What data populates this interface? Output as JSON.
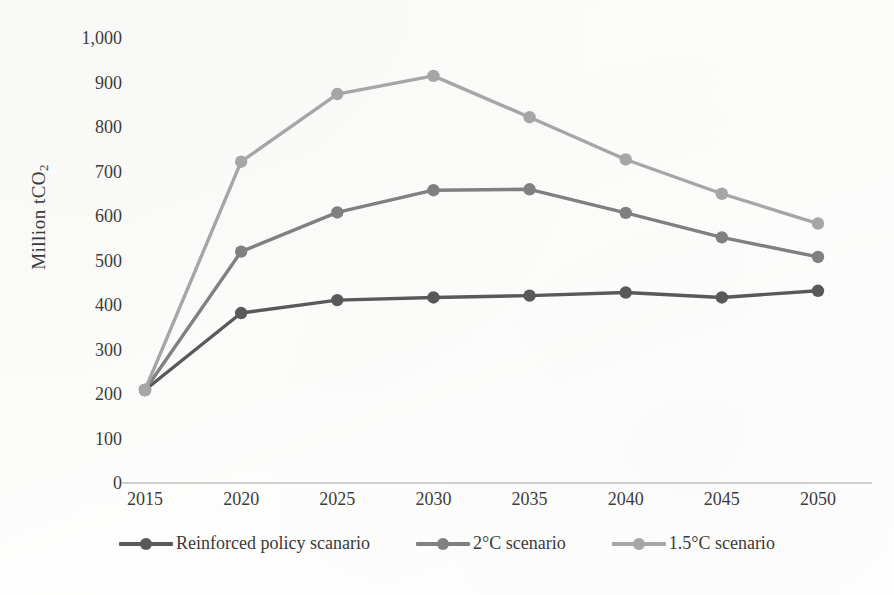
{
  "chart_data": {
    "type": "line",
    "title": "",
    "subtitle": "",
    "xlabel": "",
    "ylabel": "Million tCO2",
    "ylabel_html": "Million tCO<sub>2</sub>",
    "categories": [
      "2015",
      "2020",
      "2025",
      "2030",
      "2035",
      "2040",
      "2045",
      "2050"
    ],
    "x": [
      2015,
      2020,
      2025,
      2030,
      2035,
      2040,
      2045,
      2050
    ],
    "series": [
      {
        "name": "Reinforced policy scanario",
        "color": "#595959",
        "values": [
          209,
          382,
          411,
          417,
          421,
          428,
          417,
          432
        ]
      },
      {
        "name": "2°C scenario",
        "color": "#808080",
        "values": [
          209,
          520,
          608,
          658,
          660,
          607,
          552,
          508
        ]
      },
      {
        "name": "1.5°C scenario",
        "color": "#a6a6a6",
        "values": [
          209,
          722,
          874,
          915,
          822,
          727,
          650,
          583
        ]
      }
    ],
    "ylim": [
      0,
      1000
    ],
    "ytick_step": 100,
    "ytick_labels": [
      "1,000",
      "900",
      "800",
      "700",
      "600",
      "500",
      "400",
      "300",
      "200",
      "100",
      "0"
    ],
    "ytick_values": [
      1000,
      900,
      800,
      700,
      600,
      500,
      400,
      300,
      200,
      100,
      0
    ],
    "grid": false,
    "legend_position": "bottom",
    "marker": "circle"
  },
  "legend": {
    "items": [
      {
        "label": "Reinforced policy scanario",
        "color": "#595959"
      },
      {
        "label": "2°C scenario",
        "color": "#808080"
      },
      {
        "label": "1.5°C scenario",
        "color": "#a6a6a6"
      }
    ]
  },
  "axis": {
    "line_color": "#bfbfbf"
  }
}
